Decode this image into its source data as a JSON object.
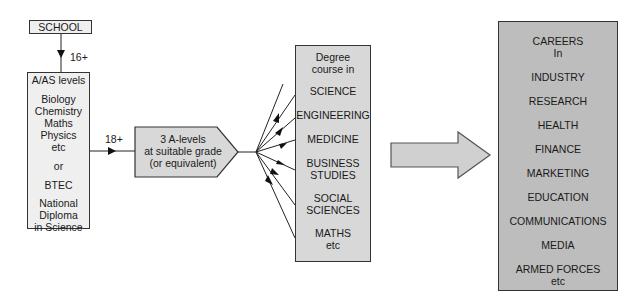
{
  "school": {
    "label": "SCHOOL"
  },
  "age_labels": {
    "first": "16+",
    "second": "18+"
  },
  "aas_box": {
    "title": "A/AS levels",
    "subjects": [
      "Biology",
      "Chemistry",
      "Maths",
      "Physics",
      "etc"
    ],
    "or": "or",
    "btec": "BTEC",
    "diploma": [
      "National",
      "Diploma",
      "in Science"
    ]
  },
  "requirement": {
    "lines": [
      "3 A-levels",
      "at suitable grade",
      "(or equivalent)"
    ]
  },
  "degree_box": {
    "title": [
      "Degree",
      "course in"
    ],
    "courses": [
      {
        "lines": [
          "SCIENCE"
        ]
      },
      {
        "lines": [
          "ENGINEERING"
        ]
      },
      {
        "lines": [
          "MEDICINE"
        ]
      },
      {
        "lines": [
          "BUSINESS",
          "STUDIES"
        ]
      },
      {
        "lines": [
          "SOCIAL",
          "SCIENCES"
        ]
      },
      {
        "lines": [
          "MATHS",
          "etc"
        ]
      }
    ]
  },
  "careers_box": {
    "title": [
      "CAREERS",
      "In"
    ],
    "items": [
      "INDUSTRY",
      "RESEARCH",
      "HEALTH",
      "FINANCE",
      "MARKETING",
      "EDUCATION",
      "COMMUNICATIONS",
      "MEDIA"
    ],
    "last": [
      "ARMED FORCES",
      "etc"
    ]
  },
  "colors": {
    "light_fill": "#efefef",
    "mid_fill": "#d8d8d8",
    "dark_fill": "#bdbdbd",
    "stroke": "#333333"
  }
}
